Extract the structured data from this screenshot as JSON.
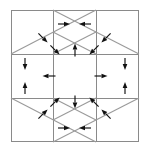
{
  "figure": {
    "type": "geometric-diagram",
    "canvas": {
      "width": 149,
      "height": 151
    },
    "background_color": "#ffffff",
    "line_color": "#8a8a8a",
    "diagonal_color": "#9a9a9a",
    "arrow_color": "#111111"
  },
  "layout": {
    "frame": {
      "x": 11,
      "y": 10,
      "width": 128,
      "height": 132
    },
    "columns_x": [
      11,
      53,
      96,
      139
    ],
    "rows_y": [
      10,
      54,
      98,
      142
    ],
    "grid": "3x3",
    "description": "Square frame divided into a three by three grid of cells; the four corner cells contain parallel diagonal lines, the four edge cells contain orthogonal arrows, and the center cell is empty."
  },
  "cells": [
    {
      "id": "top-left",
      "name": "corner-cell-top-left",
      "kind": "corner",
      "diagonals": [
        "bottom-left to top-right",
        "short parallel diagonal"
      ],
      "arrow_count": 2,
      "arrow_direction": "down-right",
      "arrow_label": "southeast"
    },
    {
      "id": "top-center",
      "name": "edge-cell-top-center",
      "kind": "edge",
      "diagonals": [],
      "arrow_count": 3,
      "arrow_direction": "right, left, up",
      "arrow_label": "inward-pair-plus-up"
    },
    {
      "id": "top-right",
      "name": "corner-cell-top-right",
      "kind": "corner",
      "diagonals": [
        "top-left to bottom-right",
        "short parallel diagonal"
      ],
      "arrow_count": 2,
      "arrow_direction": "down-left",
      "arrow_label": "southwest"
    },
    {
      "id": "middle-left",
      "name": "edge-cell-middle-left",
      "kind": "edge",
      "diagonals": [],
      "arrow_count": 3,
      "arrow_direction": "down, up, left",
      "arrow_label": "vertical-pair-plus-left"
    },
    {
      "id": "center",
      "name": "center-cell",
      "kind": "center",
      "diagonals": [],
      "arrow_count": 0,
      "arrow_direction": "none",
      "arrow_label": "empty"
    },
    {
      "id": "middle-right",
      "name": "edge-cell-middle-right",
      "kind": "edge",
      "diagonals": [],
      "arrow_count": 3,
      "arrow_direction": "right, down, up",
      "arrow_label": "right-plus-vertical-pair"
    },
    {
      "id": "bottom-left",
      "name": "corner-cell-bottom-left",
      "kind": "corner",
      "diagonals": [
        "top-left to bottom-right",
        "short parallel diagonal"
      ],
      "arrow_count": 2,
      "arrow_direction": "up-right",
      "arrow_label": "northeast"
    },
    {
      "id": "bottom-center",
      "name": "edge-cell-bottom-center",
      "kind": "edge",
      "diagonals": [],
      "arrow_count": 3,
      "arrow_direction": "down, right, left",
      "arrow_label": "down-plus-inward-pair"
    },
    {
      "id": "bottom-right",
      "name": "corner-cell-bottom-right",
      "kind": "corner",
      "diagonals": [
        "bottom-left to top-right",
        "short parallel diagonal"
      ],
      "arrow_count": 2,
      "arrow_direction": "up-left",
      "arrow_label": "northwest"
    }
  ],
  "arrows": [
    {
      "id": "a01",
      "cell": "top-left",
      "x": 43,
      "y": 38,
      "angle": 45,
      "length": 13,
      "name": "arrow-southeast-1"
    },
    {
      "id": "a02",
      "cell": "top-left",
      "x": 55,
      "y": 50,
      "angle": 45,
      "length": 13,
      "name": "arrow-southeast-2"
    },
    {
      "id": "a03",
      "cell": "top-center",
      "x": 64,
      "y": 24,
      "angle": 0,
      "length": 12,
      "name": "arrow-right-top"
    },
    {
      "id": "a04",
      "cell": "top-center",
      "x": 85,
      "y": 24,
      "angle": 180,
      "length": 12,
      "name": "arrow-left-top"
    },
    {
      "id": "a05",
      "cell": "top-center",
      "x": 75,
      "y": 50,
      "angle": 270,
      "length": 13,
      "name": "arrow-up-top"
    },
    {
      "id": "a06",
      "cell": "top-right",
      "x": 106,
      "y": 38,
      "angle": 135,
      "length": 13,
      "name": "arrow-southwest-1"
    },
    {
      "id": "a07",
      "cell": "top-right",
      "x": 94,
      "y": 50,
      "angle": 135,
      "length": 13,
      "name": "arrow-southwest-2"
    },
    {
      "id": "a08",
      "cell": "middle-left",
      "x": 25,
      "y": 64,
      "angle": 90,
      "length": 12,
      "name": "arrow-down-left-cell"
    },
    {
      "id": "a09",
      "cell": "middle-left",
      "x": 25,
      "y": 88,
      "angle": 270,
      "length": 12,
      "name": "arrow-up-left-cell"
    },
    {
      "id": "a10",
      "cell": "middle-left",
      "x": 49,
      "y": 76,
      "angle": 180,
      "length": 13,
      "name": "arrow-left-left-cell"
    },
    {
      "id": "a11",
      "cell": "middle-right",
      "x": 101,
      "y": 76,
      "angle": 0,
      "length": 13,
      "name": "arrow-right-right-cell"
    },
    {
      "id": "a12",
      "cell": "middle-right",
      "x": 125,
      "y": 64,
      "angle": 90,
      "length": 12,
      "name": "arrow-down-right-cell"
    },
    {
      "id": "a13",
      "cell": "middle-right",
      "x": 125,
      "y": 88,
      "angle": 270,
      "length": 12,
      "name": "arrow-up-right-cell"
    },
    {
      "id": "a14",
      "cell": "bottom-left",
      "x": 43,
      "y": 114,
      "angle": 315,
      "length": 13,
      "name": "arrow-northeast-1"
    },
    {
      "id": "a15",
      "cell": "bottom-left",
      "x": 55,
      "y": 102,
      "angle": 315,
      "length": 13,
      "name": "arrow-northeast-2"
    },
    {
      "id": "a16",
      "cell": "bottom-center",
      "x": 75,
      "y": 102,
      "angle": 90,
      "length": 13,
      "name": "arrow-down-bottom"
    },
    {
      "id": "a17",
      "cell": "bottom-center",
      "x": 64,
      "y": 128,
      "angle": 0,
      "length": 12,
      "name": "arrow-right-bottom"
    },
    {
      "id": "a18",
      "cell": "bottom-center",
      "x": 85,
      "y": 128,
      "angle": 180,
      "length": 12,
      "name": "arrow-left-bottom"
    },
    {
      "id": "a19",
      "cell": "bottom-right",
      "x": 106,
      "y": 114,
      "angle": 225,
      "length": 13,
      "name": "arrow-northwest-1"
    },
    {
      "id": "a20",
      "cell": "bottom-right",
      "x": 94,
      "y": 102,
      "angle": 225,
      "length": 13,
      "name": "arrow-northwest-2"
    }
  ],
  "diagonals": [
    {
      "id": "d01",
      "cell": "top-left",
      "x1": 11,
      "y1": 54,
      "x2": 96,
      "y2": 10,
      "name": "diagonal-top-left-long"
    },
    {
      "id": "d02",
      "cell": "top-left",
      "x1": 53,
      "y1": 54,
      "x2": 96,
      "y2": 32,
      "name": "diagonal-top-left-short"
    },
    {
      "id": "d03",
      "cell": "top-right",
      "x1": 53,
      "y1": 10,
      "x2": 139,
      "y2": 54,
      "name": "diagonal-top-right-long"
    },
    {
      "id": "d04",
      "cell": "top-right",
      "x1": 53,
      "y1": 32,
      "x2": 96,
      "y2": 54,
      "name": "diagonal-top-right-short"
    },
    {
      "id": "d05",
      "cell": "bottom-left",
      "x1": 11,
      "y1": 98,
      "x2": 96,
      "y2": 142,
      "name": "diagonal-bottom-left-long"
    },
    {
      "id": "d06",
      "cell": "bottom-left",
      "x1": 53,
      "y1": 98,
      "x2": 96,
      "y2": 120,
      "name": "diagonal-bottom-left-short"
    },
    {
      "id": "d07",
      "cell": "bottom-right",
      "x1": 53,
      "y1": 142,
      "x2": 139,
      "y2": 98,
      "name": "diagonal-bottom-right-long"
    },
    {
      "id": "d08",
      "cell": "bottom-right",
      "x1": 53,
      "y1": 120,
      "x2": 96,
      "y2": 98,
      "name": "diagonal-bottom-right-short"
    }
  ]
}
